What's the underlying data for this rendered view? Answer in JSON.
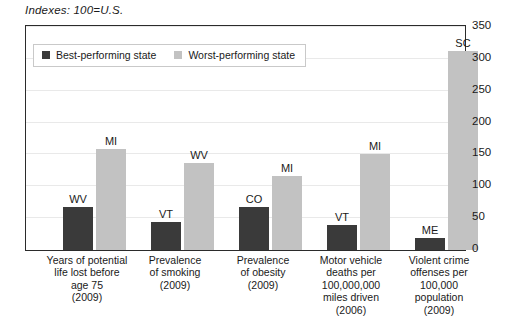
{
  "caption": "Indexes: 100=U.S.",
  "colors": {
    "best": "#3a3a3a",
    "worst": "#c2c2c2",
    "frame": "#2b2b2b",
    "grid": "#e9e9e9",
    "text": "#1a1a1a"
  },
  "legend": {
    "items": [
      {
        "label": "Best-performing state",
        "color": "#3a3a3a"
      },
      {
        "label": "Worst-performing state",
        "color": "#c2c2c2"
      }
    ]
  },
  "yticks": [
    "0",
    "50",
    "100",
    "150",
    "200",
    "250",
    "300",
    "350"
  ],
  "chart_data": {
    "type": "bar",
    "title": "Indexes: 100=U.S.",
    "xlabel": "",
    "ylabel": "",
    "ylim": [
      0,
      350
    ],
    "ytick_step": 50,
    "grid": true,
    "legend_position": "top-left-inside",
    "categories": [
      "Years of potential life lost before age 75 (2009)",
      "Prevalence of smoking (2009)",
      "Prevalence of obesity (2009)",
      "Motor vehicle deaths per 100,000,000 miles driven (2006)",
      "Violent crime offenses per 100,000 population (2009)"
    ],
    "category_lines": [
      [
        "Years of potential",
        "life lost before",
        "age 75",
        "(2009)"
      ],
      [
        "Prevalence",
        "of smoking",
        "(2009)"
      ],
      [
        "Prevalence",
        "of obesity",
        "(2009)"
      ],
      [
        "Motor vehicle",
        "deaths per",
        "100,000,000",
        "miles driven",
        "(2006)"
      ],
      [
        "Violent crime",
        "offenses per",
        "100,000",
        "population",
        "(2009)"
      ]
    ],
    "series": [
      {
        "name": "Best-performing state",
        "color": "#3a3a3a",
        "values": [
          67,
          44,
          67,
          39,
          19
        ],
        "point_labels": [
          "WV",
          "VT",
          "CO",
          "VT",
          "ME"
        ]
      },
      {
        "name": "Worst-performing state",
        "color": "#c2c2c2",
        "values": [
          158,
          136,
          116,
          150,
          312
        ],
        "point_labels": [
          "MI",
          "WV",
          "MI",
          "MI",
          "SC"
        ]
      }
    ]
  }
}
